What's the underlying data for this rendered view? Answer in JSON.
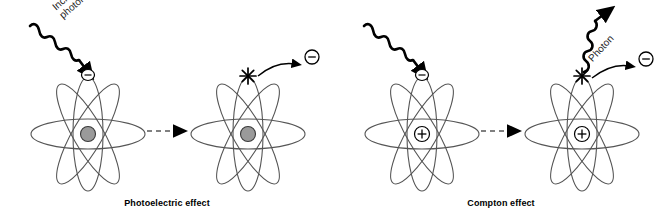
{
  "figure": {
    "background_color": "#ffffff",
    "orbital_color": "#555555",
    "nucleus_fill_photoelectric": "#9a9a9a",
    "nucleus_fill_compton": "#ffffff",
    "ink_color": "#000000",
    "dashed_arrow_color": "#808080"
  },
  "panels": [
    {
      "id": "photoelectric",
      "caption": "Photoelectric effect",
      "incoming_wave_label": {
        "line1": "Incident",
        "line2": "photon"
      },
      "before": {
        "nucleus_symbol": "",
        "nucleus_style": "filled-gray",
        "bound_electron_symbol": "−",
        "orbital_count": 4
      },
      "after": {
        "nucleus_symbol": "",
        "nucleus_style": "filled-gray",
        "ejection_marker": "starburst",
        "free_electron_symbol": "−",
        "orbital_count": 4,
        "emitted_photon": false
      },
      "transition_arrow": "dashed-right-arrow"
    },
    {
      "id": "compton",
      "caption": "Compton effect",
      "incoming_wave_label": {
        "line1": "Hard",
        "line2": "photon"
      },
      "outgoing_wave_label": {
        "line1": "Photon",
        "line2": ""
      },
      "before": {
        "nucleus_symbol": "+",
        "nucleus_style": "outline-plus",
        "bound_electron_symbol": "−",
        "orbital_count": 4
      },
      "after": {
        "nucleus_symbol": "+",
        "nucleus_style": "outline-plus",
        "ejection_marker": "starburst",
        "free_electron_symbol": "−",
        "orbital_count": 4,
        "emitted_photon": true
      },
      "transition_arrow": "dashed-right-arrow"
    }
  ]
}
